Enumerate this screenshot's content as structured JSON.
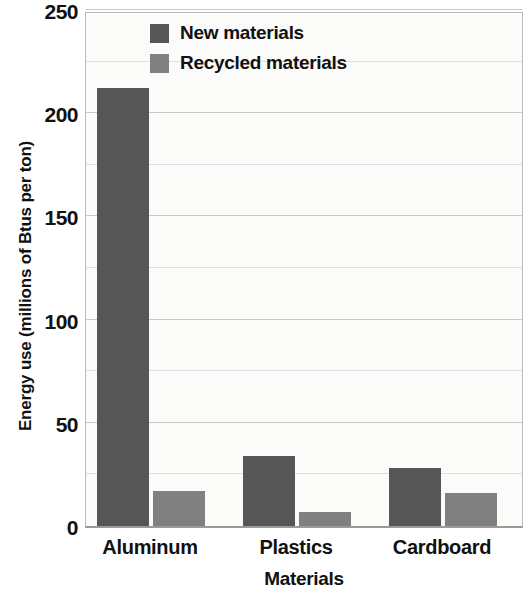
{
  "chart_data": {
    "type": "bar",
    "title": "",
    "xlabel": "Materials",
    "ylabel": "Energy use (millions of Btus per ton)",
    "categories": [
      "Aluminum",
      "Plastics",
      "Cardboard"
    ],
    "series": [
      {
        "name": "New materials",
        "color": "#565656",
        "values": [
          212,
          34,
          28
        ]
      },
      {
        "name": "Recycled materials",
        "color": "#808080",
        "values": [
          17,
          7,
          16
        ]
      }
    ],
    "ylim": [
      0,
      250
    ],
    "ytick_labels": [
      "0",
      "50",
      "100",
      "150",
      "200",
      "250"
    ],
    "ytick_values": [
      0,
      50,
      100,
      150,
      200,
      250
    ],
    "gridline_values": [
      25,
      50,
      75,
      100,
      125,
      150,
      175,
      200,
      225,
      250
    ],
    "grid": true,
    "legend_position": "top-center",
    "plot_background": "#fbfbfa",
    "axis_color": "#b9b9b6"
  }
}
